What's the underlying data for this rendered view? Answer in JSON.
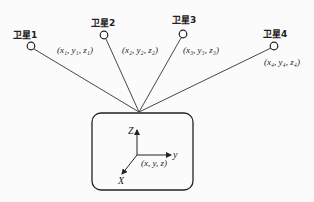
{
  "satellites": [
    {
      "label": "卫星1",
      "coord": "(x₁, y₁, z₁)"
    },
    {
      "label": "卫星2",
      "coord": "(x₂, y₂, z₂)"
    },
    {
      "label": "卫星3",
      "coord": "(x₃, y₃, z₃)"
    },
    {
      "label": "卫星4",
      "coord": "(x₄, y₄, z₄)"
    }
  ],
  "receiver": {
    "axis_x": "X",
    "axis_y": "y",
    "axis_z": "Z",
    "coord": "(x, y, z)"
  }
}
